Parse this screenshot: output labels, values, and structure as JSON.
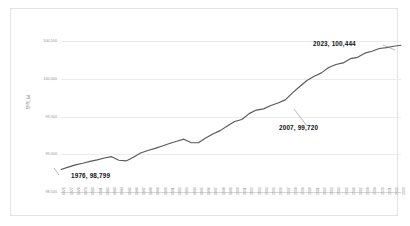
{
  "chart_data": {
    "type": "line",
    "title": "",
    "xlabel": "",
    "ylabel": "면적, ㎢",
    "ylim": [
      98500,
      100500
    ],
    "yticks": [
      "100,500",
      "100,000",
      "99,500",
      "99,000",
      "98,500"
    ],
    "ytick_values": [
      100500,
      100000,
      99500,
      99000,
      98500
    ],
    "grid": true,
    "legend": "none",
    "line_color": "#595959",
    "categories": [
      "1976",
      "1977",
      "1978",
      "1979",
      "1980",
      "1981",
      "1982",
      "1983",
      "1984",
      "1985",
      "1986",
      "1987",
      "1988",
      "1989",
      "1990",
      "1991",
      "1992",
      "1993",
      "1994",
      "1995",
      "1996",
      "1997",
      "1998",
      "1999",
      "2000",
      "2001",
      "2002",
      "2003",
      "2004",
      "2005",
      "2006",
      "2007",
      "2008",
      "2009",
      "2010",
      "2011",
      "2012",
      "2013",
      "2014",
      "2015",
      "2016",
      "2017",
      "2018",
      "2019",
      "2020",
      "2021",
      "2022",
      "2023"
    ],
    "values": [
      98799,
      98830,
      98859,
      98880,
      98905,
      98925,
      98950,
      98968,
      98920,
      98912,
      98960,
      99016,
      99050,
      99078,
      99110,
      99143,
      99173,
      99200,
      99153,
      99152,
      99215,
      99268,
      99313,
      99373,
      99434,
      99461,
      99538,
      99585,
      99601,
      99646,
      99678,
      99720,
      99812,
      99897,
      99977,
      100033,
      100078,
      100148,
      100188,
      100210,
      100266,
      100284,
      100339,
      100364,
      100401,
      100413,
      100431,
      100444
    ],
    "annotations": [
      {
        "name": "start-point",
        "label": "1976,  98,799",
        "year": "1976",
        "value": "98,799"
      },
      {
        "name": "mid-point",
        "label": "2007,  99,720",
        "year": "2007",
        "value": "99,720"
      },
      {
        "name": "end-point",
        "label": "2023,  100,444",
        "year": "2023",
        "value": "100,444"
      }
    ]
  }
}
